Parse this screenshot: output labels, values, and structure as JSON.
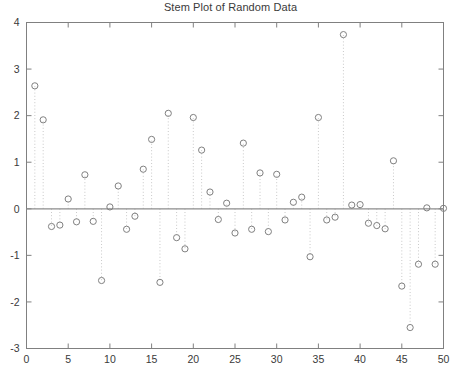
{
  "chart_data": {
    "type": "stem",
    "title": "Stem Plot of Random Data",
    "xlabel": "",
    "ylabel": "",
    "xlim": [
      0,
      50
    ],
    "ylim": [
      -3,
      4
    ],
    "xticks": [
      0,
      5,
      10,
      15,
      20,
      25,
      30,
      35,
      40,
      45,
      50
    ],
    "yticks": [
      -3,
      -2,
      -1,
      0,
      1,
      2,
      3,
      4
    ],
    "xticklabels": [
      "0",
      "5",
      "10",
      "15",
      "20",
      "25",
      "30",
      "35",
      "40",
      "45",
      "50"
    ],
    "yticklabels": [
      "-3",
      "-2",
      "-1",
      "0",
      "1",
      "2",
      "3",
      "4"
    ],
    "grid": false,
    "legend": null,
    "baseline": 0,
    "marker": "open-circle",
    "marker_color": "#808080",
    "stem_color": "#c8c8c8",
    "stem_style": "dotted",
    "baseline_color": "#8c8c8c",
    "axes_color": "#808080",
    "x": [
      1,
      2,
      3,
      4,
      5,
      6,
      7,
      8,
      9,
      10,
      11,
      12,
      13,
      14,
      15,
      16,
      17,
      18,
      19,
      20,
      21,
      22,
      23,
      24,
      25,
      26,
      27,
      28,
      29,
      30,
      31,
      32,
      33,
      34,
      35,
      36,
      37,
      38,
      39,
      40,
      41,
      42,
      43,
      44,
      45,
      46,
      47,
      48,
      49,
      50
    ],
    "values": [
      2.64,
      1.91,
      -0.38,
      -0.35,
      0.21,
      -0.28,
      0.73,
      -0.27,
      -1.54,
      0.04,
      0.49,
      -0.44,
      -0.16,
      0.85,
      1.49,
      -1.58,
      2.05,
      -0.62,
      -0.86,
      1.96,
      1.26,
      0.36,
      -0.23,
      0.12,
      -0.52,
      1.41,
      -0.44,
      0.77,
      -0.49,
      0.74,
      -0.24,
      0.14,
      0.25,
      -1.03,
      1.96,
      -0.24,
      -0.18,
      3.74,
      0.08,
      0.09,
      -0.31,
      -0.36,
      -0.43,
      1.03,
      -1.66,
      -2.55,
      -1.19,
      0.02,
      -1.19,
      0.01
    ]
  }
}
